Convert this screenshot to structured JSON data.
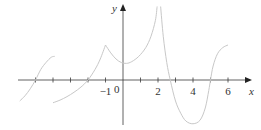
{
  "chart_data": {
    "type": "line",
    "title": "",
    "xlabel": "x",
    "ylabel": "y",
    "xlim": [
      -6,
      7
    ],
    "ylim": [
      -3.5,
      4.5
    ],
    "grid": false,
    "x_ticks": [
      -5,
      -4,
      -3,
      -2,
      -1,
      1,
      2,
      3,
      4,
      5,
      6
    ],
    "x_tick_labels": [
      {
        "x": -1,
        "label": "−1"
      },
      {
        "x": 2,
        "label": "2"
      },
      {
        "x": 4,
        "label": "4"
      },
      {
        "x": 6,
        "label": "6"
      }
    ],
    "origin_label": "0",
    "line_color": "#c8c8c8",
    "axis_color": "#3a3a3a",
    "series": [
      {
        "name": "piece-1",
        "points": [
          [
            -5.9,
            -1.2
          ],
          [
            -5.6,
            -0.9
          ],
          [
            -5.3,
            -0.5
          ],
          [
            -5.0,
            0
          ],
          [
            -4.7,
            0.6
          ],
          [
            -4.4,
            1.0
          ],
          [
            -4.1,
            1.3
          ],
          [
            -3.9,
            1.35
          ]
        ]
      },
      {
        "name": "piece-2",
        "points": [
          [
            -4.0,
            -1.3
          ],
          [
            -3.6,
            -1.15
          ],
          [
            -3.2,
            -0.95
          ],
          [
            -2.8,
            -0.7
          ],
          [
            -2.4,
            -0.4
          ],
          [
            -2.0,
            0
          ],
          [
            -1.6,
            0.6
          ],
          [
            -1.3,
            1.2
          ],
          [
            -1.0,
            2.0
          ]
        ]
      },
      {
        "name": "piece-3",
        "points": [
          [
            -1.0,
            2.0
          ],
          [
            -0.7,
            1.55
          ],
          [
            -0.4,
            1.2
          ],
          [
            -0.1,
            1.0
          ],
          [
            0.2,
            0.95
          ],
          [
            0.5,
            1.05
          ],
          [
            0.9,
            1.35
          ],
          [
            1.3,
            1.85
          ],
          [
            1.6,
            2.5
          ],
          [
            1.85,
            3.4
          ],
          [
            1.95,
            4.2
          ]
        ]
      },
      {
        "name": "piece-4",
        "points": [
          [
            2.15,
            4.2
          ],
          [
            2.3,
            2.5
          ],
          [
            2.5,
            1.0
          ],
          [
            2.7,
            0
          ],
          [
            3.0,
            -1.2
          ],
          [
            3.3,
            -1.9
          ],
          [
            3.6,
            -2.35
          ],
          [
            4.0,
            -2.5
          ],
          [
            4.4,
            -2.3
          ],
          [
            4.7,
            -1.6
          ],
          [
            4.9,
            -0.6
          ],
          [
            5.0,
            0
          ],
          [
            5.15,
            0.8
          ],
          [
            5.4,
            1.5
          ],
          [
            5.7,
            1.85
          ],
          [
            6.0,
            2.0
          ]
        ]
      }
    ]
  }
}
